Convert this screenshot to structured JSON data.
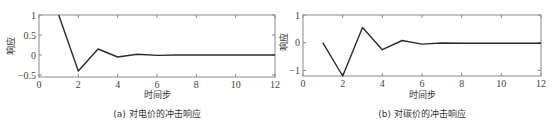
{
  "chart_data": [
    {
      "type": "line",
      "id": "a",
      "caption": "(a) 对电价的冲击响应",
      "title": "",
      "xlabel": "时间步",
      "ylabel": "响应",
      "x": [
        1,
        2,
        3,
        4,
        5,
        6,
        7,
        8,
        9,
        10,
        11,
        12
      ],
      "values": [
        1.0,
        -0.4,
        0.15,
        -0.05,
        0.02,
        -0.01,
        0.0,
        0.0,
        0.0,
        0.0,
        0.0,
        0.0
      ],
      "xlim": [
        0,
        12
      ],
      "ylim": [
        -0.55,
        1.0
      ],
      "xticks": [
        0,
        2,
        4,
        6,
        8,
        10,
        12
      ],
      "yticks": [
        -0.5,
        0,
        0.5,
        1
      ],
      "ytick_labels": [
        "-0.5",
        "0",
        "0.5",
        "1"
      ],
      "grid": false,
      "legend": null
    },
    {
      "type": "line",
      "id": "b",
      "caption": "(b) 对碳价的冲击响应",
      "title": "",
      "xlabel": "时间步",
      "ylabel": "响应",
      "x": [
        1,
        2,
        3,
        4,
        5,
        6,
        7,
        8,
        9,
        10,
        11,
        12
      ],
      "values": [
        0.0,
        -1.2,
        0.55,
        -0.25,
        0.08,
        -0.05,
        -0.01,
        -0.02,
        -0.02,
        -0.02,
        -0.02,
        -0.02
      ],
      "xlim": [
        0,
        12
      ],
      "ylim": [
        -1.2,
        1.0
      ],
      "xticks": [
        0,
        2,
        4,
        6,
        8,
        10,
        12
      ],
      "yticks": [
        -1,
        0,
        1
      ],
      "ytick_labels": [
        "-1",
        "0",
        "1"
      ],
      "grid": false,
      "legend": null
    }
  ]
}
